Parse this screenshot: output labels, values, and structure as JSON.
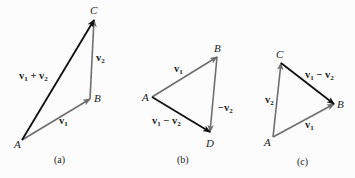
{
  "colors": {
    "dark_vector": "#111111",
    "light_vector": "#6e6e6e",
    "text": "#222222",
    "background": "#fcfcfc"
  },
  "panels": [
    {
      "caption": "(a)",
      "points": {
        "A": {
          "label": "A",
          "x": 22,
          "y": 140
        },
        "B": {
          "label": "B",
          "x": 90,
          "y": 99
        },
        "C": {
          "label": "C",
          "x": 94,
          "y": 20
        }
      },
      "vectors": [
        {
          "from": "A",
          "to": "B",
          "label": "v",
          "sub": "1",
          "suffix": "",
          "style": "light"
        },
        {
          "from": "B",
          "to": "C",
          "label": "v",
          "sub": "2",
          "suffix": "",
          "style": "light"
        },
        {
          "from": "A",
          "to": "C",
          "label": "v₁ + v₂",
          "style": "dark"
        }
      ],
      "vector_labels": {
        "v1": "v",
        "v1_sub": "1",
        "v2": "v",
        "v2_sub": "2",
        "sum_a": "v",
        "sum_a_sub": "1",
        "sum_op": " + ",
        "sum_b": "v",
        "sum_b_sub": "2"
      }
    },
    {
      "caption": "(b)",
      "points": {
        "A": {
          "label": "A",
          "x": 152,
          "y": 97
        },
        "B": {
          "label": "B",
          "x": 217,
          "y": 57
        },
        "D": {
          "label": "D",
          "x": 210,
          "y": 132
        }
      },
      "vectors": [
        {
          "from": "A",
          "to": "B",
          "label": "v₁",
          "style": "light"
        },
        {
          "from": "B",
          "to": "D",
          "label": "−v₂",
          "style": "light"
        },
        {
          "from": "A",
          "to": "D",
          "label": "v₁ − v₂",
          "style": "dark"
        }
      ],
      "vector_labels": {
        "v1": "v",
        "v1_sub": "1",
        "neg_op": "−",
        "negv2": "v",
        "negv2_sub": "2",
        "diff_a": "v",
        "diff_a_sub": "1",
        "diff_op": " − ",
        "diff_b": "v",
        "diff_b_sub": "2"
      }
    },
    {
      "caption": "(c)",
      "points": {
        "A": {
          "label": "A",
          "x": 273,
          "y": 137
        },
        "B": {
          "label": "B",
          "x": 334,
          "y": 104
        },
        "C": {
          "label": "C",
          "x": 281,
          "y": 63
        }
      },
      "vectors": [
        {
          "from": "A",
          "to": "B",
          "label": "v₁",
          "style": "light"
        },
        {
          "from": "A",
          "to": "C",
          "label": "v₂",
          "style": "light"
        },
        {
          "from": "C",
          "to": "B",
          "label": "v₁ − v₂",
          "style": "dark"
        }
      ],
      "vector_labels": {
        "v1": "v",
        "v1_sub": "1",
        "v2": "v",
        "v2_sub": "2",
        "diff_a": "v",
        "diff_a_sub": "1",
        "diff_op": " − ",
        "diff_b": "v",
        "diff_b_sub": "2"
      }
    }
  ]
}
